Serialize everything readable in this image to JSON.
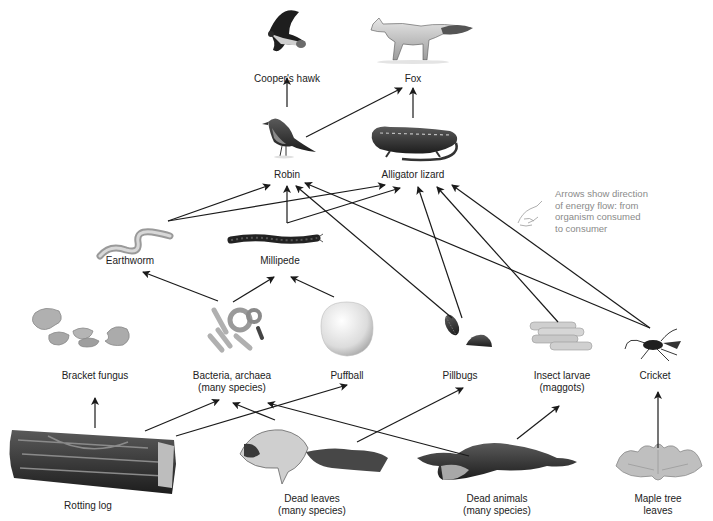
{
  "diagram": {
    "title": "",
    "note": {
      "lines": [
        "Arrows show direction",
        "of energy flow: from",
        "organism consumed",
        "to consumer"
      ],
      "icon": "pointing-hand-icon",
      "color": "#8a8a8a"
    },
    "colors": {
      "arrow": "#1a1a1a",
      "text": "#222222",
      "background": "#ffffff"
    },
    "nodes": [
      {
        "id": "hawk",
        "label": "Cooper's hawk",
        "icon": "hawk-icon",
        "x": 287,
        "y": 40,
        "label_y": 73
      },
      {
        "id": "fox",
        "label": "Fox",
        "icon": "fox-icon",
        "x": 413,
        "y": 40,
        "label_y": 73
      },
      {
        "id": "robin",
        "label": "Robin",
        "icon": "robin-icon",
        "x": 287,
        "y": 138,
        "label_y": 169
      },
      {
        "id": "lizard",
        "label": "Alligator lizard",
        "icon": "lizard-icon",
        "x": 413,
        "y": 145,
        "label_y": 169
      },
      {
        "id": "earthworm",
        "label": "Earthworm",
        "icon": "earthworm-icon",
        "x": 130,
        "y": 240,
        "label_y": 255
      },
      {
        "id": "millipede",
        "label": "Millipede",
        "icon": "millipede-icon",
        "x": 280,
        "y": 240,
        "label_y": 255
      },
      {
        "id": "bracket",
        "label": "Bracket fungus",
        "icon": "bracket-fungus-icon",
        "x": 95,
        "y": 335,
        "label_y": 370
      },
      {
        "id": "bacteria",
        "label": "Bacteria, archaea\n(many species)",
        "label_lines": [
          "Bacteria, archaea",
          "(many species)"
        ],
        "icon": "bacteria-icon",
        "x": 232,
        "y": 330,
        "label_y": 370
      },
      {
        "id": "puffball",
        "label": "Puffball",
        "icon": "puffball-icon",
        "x": 347,
        "y": 332,
        "label_y": 370
      },
      {
        "id": "pillbugs",
        "label": "Pillbugs",
        "icon": "pillbug-icon",
        "x": 460,
        "y": 335,
        "label_y": 370
      },
      {
        "id": "larvae",
        "label": "Insect larvae\n(maggots)",
        "label_lines": [
          "Insect larvae",
          "(maggots)"
        ],
        "icon": "maggots-icon",
        "x": 562,
        "y": 338,
        "label_y": 370
      },
      {
        "id": "cricket",
        "label": "Cricket",
        "icon": "cricket-icon",
        "x": 655,
        "y": 345,
        "label_y": 370
      },
      {
        "id": "log",
        "label": "Rotting log",
        "icon": "rotting-log-icon",
        "x": 88,
        "y": 460,
        "label_y": 500
      },
      {
        "id": "deadleaves",
        "label": "Dead leaves\n(many species)",
        "label_lines": [
          "Dead leaves",
          "(many species)"
        ],
        "icon": "dead-leaves-icon",
        "x": 312,
        "y": 462,
        "label_y": 493
      },
      {
        "id": "deadanimals",
        "label": "Dead animals\n(many species)",
        "label_lines": [
          "Dead animals",
          "(many species)"
        ],
        "icon": "dead-animal-icon",
        "x": 497,
        "y": 462,
        "label_y": 493
      },
      {
        "id": "maple",
        "label": "Maple tree\nleaves",
        "label_lines": [
          "Maple tree",
          "leaves"
        ],
        "icon": "maple-leaves-icon",
        "x": 658,
        "y": 462,
        "label_y": 493
      }
    ],
    "edges": [
      {
        "from": "robin",
        "to": "hawk",
        "points": [
          [
            287,
            107
          ],
          [
            287,
            78
          ]
        ]
      },
      {
        "from": "robin",
        "to": "fox",
        "points": [
          [
            306,
            137
          ],
          [
            402,
            88
          ]
        ]
      },
      {
        "from": "lizard",
        "to": "fox",
        "points": [
          [
            413,
            118
          ],
          [
            413,
            88
          ]
        ]
      },
      {
        "from": "earthworm",
        "to": "robin",
        "points": [
          [
            168,
            221
          ],
          [
            270,
            185
          ]
        ]
      },
      {
        "from": "earthworm",
        "to": "lizard",
        "points": [
          [
            168,
            221
          ],
          [
            385,
            185
          ]
        ]
      },
      {
        "from": "millipede",
        "to": "robin",
        "points": [
          [
            287,
            223
          ],
          [
            287,
            186
          ]
        ]
      },
      {
        "from": "millipede",
        "to": "lizard",
        "points": [
          [
            287,
            223
          ],
          [
            400,
            188
          ]
        ]
      },
      {
        "from": "pillbugs",
        "to": "robin",
        "points": [
          [
            452,
            318
          ],
          [
            296,
            186
          ]
        ]
      },
      {
        "from": "pillbugs",
        "to": "lizard",
        "points": [
          [
            462,
            318
          ],
          [
            418,
            187
          ]
        ]
      },
      {
        "from": "larvae",
        "to": "lizard",
        "points": [
          [
            558,
            322
          ],
          [
            437,
            187
          ]
        ]
      },
      {
        "from": "cricket",
        "to": "robin",
        "points": [
          [
            650,
            328
          ],
          [
            305,
            183
          ]
        ]
      },
      {
        "from": "cricket",
        "to": "lizard",
        "points": [
          [
            650,
            328
          ],
          [
            452,
            185
          ]
        ]
      },
      {
        "from": "bacteria",
        "to": "earthworm",
        "points": [
          [
            218,
            301
          ],
          [
            143,
            272
          ]
        ]
      },
      {
        "from": "bacteria",
        "to": "millipede",
        "points": [
          [
            233,
            302
          ],
          [
            274,
            277
          ]
        ]
      },
      {
        "from": "puffball",
        "to": "millipede",
        "points": [
          [
            334,
            297
          ],
          [
            291,
            277
          ]
        ]
      },
      {
        "from": "log",
        "to": "bracket",
        "points": [
          [
            95,
            428
          ],
          [
            95,
            398
          ]
        ]
      },
      {
        "from": "log",
        "to": "bacteria",
        "points": [
          [
            145,
            431
          ],
          [
            219,
            400
          ]
        ]
      },
      {
        "from": "log",
        "to": "puffball",
        "points": [
          [
            176,
            436
          ],
          [
            347,
            385
          ]
        ]
      },
      {
        "from": "deadleaves",
        "to": "bacteria",
        "points": [
          [
            275,
            420
          ],
          [
            233,
            403
          ]
        ]
      },
      {
        "from": "deadleaves",
        "to": "pillbugs",
        "points": [
          [
            357,
            442
          ],
          [
            463,
            388
          ]
        ]
      },
      {
        "from": "deadanimals",
        "to": "bacteria",
        "points": [
          [
            469,
            456
          ],
          [
            268,
            403
          ]
        ]
      },
      {
        "from": "deadanimals",
        "to": "larvae",
        "points": [
          [
            517,
            439
          ],
          [
            559,
            406
          ]
        ]
      },
      {
        "from": "maple",
        "to": "cricket",
        "points": [
          [
            658,
            448
          ],
          [
            658,
            392
          ]
        ]
      }
    ]
  }
}
